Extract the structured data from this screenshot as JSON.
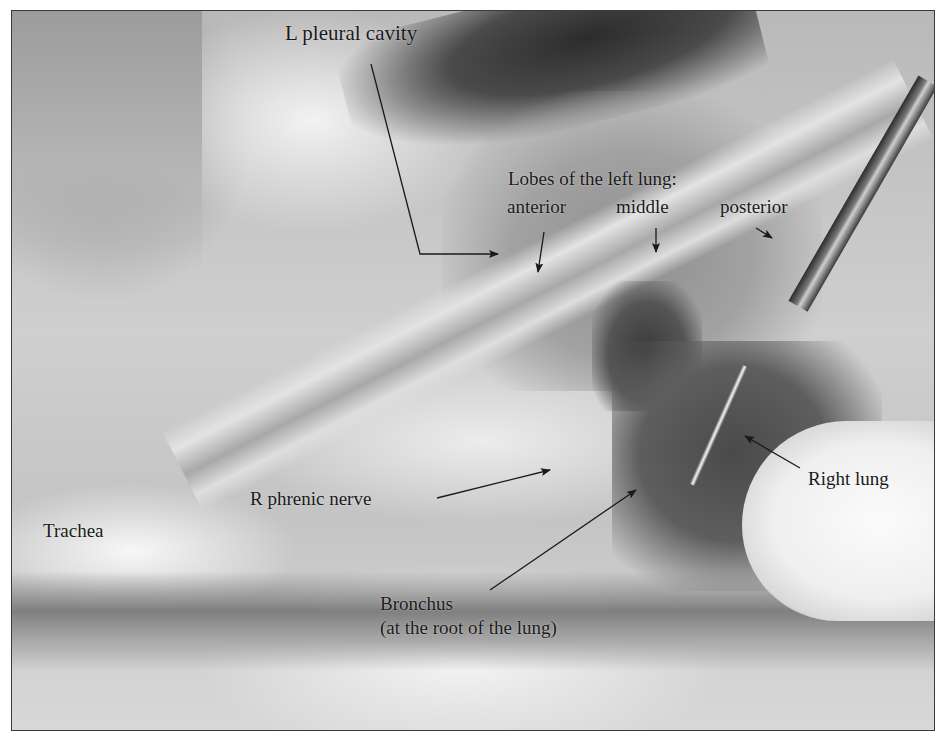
{
  "figure": {
    "style": "grayscale photograph with thin dark border",
    "labels": {
      "l_pleural_cavity": "L pleural cavity",
      "lobes_heading": "Lobes of the left lung:",
      "lobe_anterior": "anterior",
      "lobe_middle": "middle",
      "lobe_posterior": "posterior",
      "right_lung": "Right lung",
      "r_phrenic_nerve": "R phrenic nerve",
      "trachea": "Trachea",
      "bronchus": "Bronchus",
      "bronchus_note": "(at the root of the lung)"
    },
    "colors": {
      "label_text": "#1a1a1a",
      "arrow": "#1a1a1a",
      "border": "#3a3a3a"
    }
  }
}
